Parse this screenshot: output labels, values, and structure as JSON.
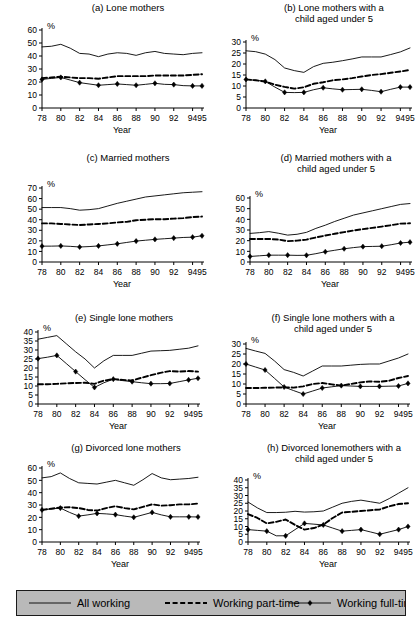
{
  "figure": {
    "axis_title_x": "Year",
    "axis_title_y": "%",
    "years": [
      78,
      80,
      82,
      84,
      86,
      88,
      90,
      92,
      94,
      95
    ],
    "xtick_labels": [
      "78",
      "80",
      "82",
      "84",
      "86",
      "88",
      "90",
      "92",
      "94",
      "95"
    ],
    "line_color": "#000000",
    "background_color": "#ffffff",
    "legend": {
      "background_color": "#b9b9b9",
      "border_color": "#1a1a1a",
      "items": [
        {
          "key": "all_working",
          "label": "All working",
          "style": "solid",
          "marker": "none"
        },
        {
          "key": "part_time",
          "label": "Working part-time",
          "style": "dashed",
          "marker": "none"
        },
        {
          "key": "full_time",
          "label": "Working full-time",
          "style": "solid",
          "marker": "diamond"
        }
      ]
    }
  },
  "chart_data": [
    {
      "id": "a",
      "type": "line",
      "title": "(a) Lone mothers",
      "xlabel": "Year",
      "ylabel": "%",
      "ylim": [
        0,
        60
      ],
      "ytick_step": 10,
      "ytick_labels": [
        "0",
        "10",
        "20",
        "30",
        "40",
        "50",
        "60"
      ],
      "grid": false,
      "x": [
        78,
        79,
        80,
        81,
        82,
        83,
        84,
        85,
        86,
        87,
        88,
        89,
        90,
        91,
        92,
        93,
        94,
        95
      ],
      "series": [
        {
          "name": "All working",
          "values": [
            47.0,
            47.5,
            49.0,
            46.0,
            42.0,
            41.5,
            39.5,
            41.5,
            42.5,
            42.0,
            40.5,
            42.5,
            43.5,
            42.0,
            41.5,
            41.0,
            42.0,
            42.5
          ]
        },
        {
          "name": "Working part-time",
          "values": [
            23.0,
            23.5,
            24.0,
            23.5,
            23.0,
            23.0,
            22.5,
            23.5,
            24.5,
            24.5,
            24.5,
            24.5,
            25.0,
            25.0,
            25.0,
            25.0,
            25.5,
            26.0
          ]
        },
        {
          "name": "Working full-time",
          "values": [
            22.0,
            22.8,
            23.5,
            21.5,
            19.5,
            18.5,
            17.5,
            18.0,
            18.5,
            18.0,
            17.5,
            18.2,
            19.0,
            18.2,
            18.0,
            17.2,
            17.0,
            17.0
          ]
        }
      ],
      "marker_x": [
        78,
        80,
        82,
        84,
        86,
        88,
        90,
        92,
        94,
        95
      ],
      "marker_y": [
        22.0,
        23.5,
        19.5,
        17.5,
        18.5,
        17.5,
        19.0,
        18.0,
        17.0,
        17.0
      ]
    },
    {
      "id": "b",
      "type": "line",
      "title": "(b) Lone mothers with a child aged under 5",
      "xlabel": "Year",
      "ylabel": "%",
      "ylim": [
        0,
        30
      ],
      "ytick_step": 5,
      "ytick_labels": [
        "0",
        "5",
        "10",
        "15",
        "20",
        "25",
        "30"
      ],
      "grid": false,
      "x": [
        78,
        79,
        80,
        81,
        82,
        83,
        84,
        85,
        86,
        87,
        88,
        89,
        90,
        91,
        92,
        93,
        94,
        95
      ],
      "series": [
        {
          "name": "All working",
          "values": [
            26.0,
            25.6,
            24.5,
            22.0,
            18.2,
            17.0,
            16.2,
            18.8,
            20.3,
            20.8,
            21.5,
            22.3,
            23.2,
            23.2,
            23.2,
            24.3,
            25.5,
            27.3
          ]
        },
        {
          "name": "Working part-time",
          "values": [
            13.0,
            12.6,
            12.0,
            10.6,
            9.6,
            8.8,
            9.4,
            11.0,
            11.7,
            12.6,
            13.0,
            13.6,
            14.3,
            15.0,
            15.4,
            16.0,
            16.6,
            17.3
          ]
        },
        {
          "name": "Working full-time",
          "values": [
            13.0,
            12.6,
            12.1,
            9.5,
            7.1,
            7.0,
            7.1,
            8.3,
            9.2,
            8.7,
            8.3,
            8.4,
            8.5,
            8.0,
            7.4,
            8.5,
            9.5,
            9.5
          ]
        }
      ],
      "marker_x": [
        78,
        80,
        82,
        84,
        86,
        88,
        90,
        92,
        94,
        95
      ],
      "marker_y": [
        13.0,
        12.1,
        7.1,
        7.1,
        9.2,
        8.3,
        8.5,
        7.4,
        9.5,
        9.5
      ]
    },
    {
      "id": "c",
      "type": "line",
      "title": "(c) Married mothers",
      "xlabel": "Year",
      "ylabel": "%",
      "ylim": [
        0,
        70
      ],
      "ytick_step": 10,
      "ytick_labels": [
        "0",
        "10",
        "20",
        "30",
        "40",
        "50",
        "60",
        "70"
      ],
      "grid": false,
      "x": [
        78,
        79,
        80,
        81,
        82,
        83,
        84,
        85,
        86,
        87,
        88,
        89,
        90,
        91,
        92,
        93,
        94,
        95
      ],
      "series": [
        {
          "name": "All working",
          "values": [
            51.5,
            51.5,
            51.5,
            50.5,
            49.0,
            49.5,
            50.5,
            53.0,
            55.5,
            57.5,
            59.5,
            61.5,
            62.5,
            63.5,
            64.5,
            65.5,
            66.0,
            66.5
          ]
        },
        {
          "name": "Working part-time",
          "values": [
            36.5,
            36.5,
            36.0,
            35.5,
            35.0,
            35.5,
            36.0,
            36.5,
            37.5,
            38.0,
            39.5,
            40.0,
            40.5,
            40.5,
            41.0,
            41.5,
            42.5,
            43.0
          ]
        },
        {
          "name": "Working full-time",
          "values": [
            15.0,
            15.0,
            15.2,
            14.8,
            14.2,
            14.6,
            15.2,
            16.2,
            17.2,
            18.5,
            19.8,
            20.6,
            21.4,
            22.0,
            22.6,
            23.2,
            23.5,
            24.8
          ]
        }
      ],
      "marker_x": [
        78,
        80,
        82,
        84,
        86,
        88,
        90,
        92,
        94,
        95
      ],
      "marker_y": [
        15.0,
        15.2,
        14.2,
        15.2,
        17.2,
        19.8,
        21.4,
        22.6,
        23.5,
        24.8
      ]
    },
    {
      "id": "d",
      "type": "line",
      "title": "(d) Married mothers with a child aged under 5",
      "xlabel": "Year",
      "ylabel": "%",
      "ylim": [
        0,
        60
      ],
      "ytick_step": 10,
      "ytick_labels": [
        "0",
        "10",
        "20",
        "30",
        "40",
        "50",
        "60"
      ],
      "grid": false,
      "x": [
        78,
        79,
        80,
        81,
        82,
        83,
        84,
        85,
        86,
        87,
        88,
        89,
        90,
        91,
        92,
        93,
        94,
        95
      ],
      "series": [
        {
          "name": "All working",
          "values": [
            26.8,
            27.5,
            28.5,
            27.0,
            25.2,
            26.0,
            27.8,
            31.5,
            34.5,
            38.0,
            41.0,
            44.0,
            46.0,
            48.0,
            50.0,
            52.0,
            54.0,
            54.8
          ]
        },
        {
          "name": "Working part-time",
          "values": [
            21.5,
            21.6,
            21.6,
            21.0,
            19.6,
            20.0,
            21.0,
            23.0,
            24.8,
            26.5,
            28.0,
            29.5,
            30.8,
            32.0,
            33.2,
            34.5,
            36.0,
            36.3
          ]
        },
        {
          "name": "Working full-time",
          "values": [
            5.2,
            5.8,
            6.4,
            6.4,
            6.4,
            6.2,
            6.3,
            7.8,
            9.6,
            11.0,
            12.4,
            13.5,
            14.4,
            14.6,
            14.8,
            16.2,
            17.8,
            18.6
          ]
        }
      ],
      "marker_x": [
        78,
        80,
        82,
        84,
        86,
        88,
        90,
        92,
        94,
        95
      ],
      "marker_y": [
        5.2,
        6.4,
        6.4,
        6.3,
        9.6,
        12.4,
        14.4,
        14.8,
        17.8,
        18.6
      ]
    },
    {
      "id": "e",
      "type": "line",
      "title": "(e) Single lone mothers",
      "xlabel": "Year",
      "ylabel": "%",
      "ylim": [
        0,
        40
      ],
      "ytick_step": 5,
      "ytick_labels": [
        "0",
        "5",
        "10",
        "15",
        "20",
        "25",
        "30",
        "35",
        "40"
      ],
      "grid": false,
      "x": [
        78,
        79,
        80,
        81,
        82,
        83,
        84,
        85,
        86,
        87,
        88,
        89,
        90,
        91,
        92,
        93,
        94,
        95
      ],
      "series": [
        {
          "name": "All working",
          "values": [
            36.0,
            37.0,
            38.0,
            33.5,
            29.0,
            25.0,
            20.0,
            24.0,
            27.0,
            27.0,
            27.0,
            28.2,
            29.4,
            29.6,
            29.8,
            30.4,
            31.0,
            32.3
          ]
        },
        {
          "name": "Working part-time",
          "values": [
            11.0,
            11.0,
            11.2,
            11.5,
            11.7,
            11.8,
            11.2,
            13.0,
            13.8,
            13.4,
            13.0,
            14.6,
            16.0,
            17.3,
            18.3,
            18.0,
            18.3,
            18.0
          ]
        },
        {
          "name": "Working full-time",
          "values": [
            25.2,
            26.0,
            27.0,
            22.5,
            18.0,
            13.5,
            9.2,
            11.8,
            13.8,
            13.0,
            12.4,
            11.8,
            11.3,
            11.3,
            11.4,
            12.4,
            13.4,
            14.3
          ]
        }
      ],
      "marker_x": [
        78,
        80,
        82,
        84,
        86,
        88,
        90,
        92,
        94,
        95
      ],
      "marker_y": [
        25.2,
        27.0,
        18.0,
        9.2,
        13.8,
        12.4,
        11.3,
        11.4,
        13.4,
        14.3
      ]
    },
    {
      "id": "f",
      "type": "line",
      "title": "(f) Single lone mothers with a child aged under 5",
      "xlabel": "Year",
      "ylabel": "%",
      "ylim": [
        0,
        30
      ],
      "ytick_step": 5,
      "ytick_labels": [
        "0",
        "5",
        "10",
        "15",
        "20",
        "25",
        "30"
      ],
      "grid": false,
      "x": [
        78,
        79,
        80,
        81,
        82,
        83,
        84,
        85,
        86,
        87,
        88,
        89,
        90,
        91,
        92,
        93,
        94,
        95
      ],
      "series": [
        {
          "name": "All working",
          "values": [
            27.8,
            26.5,
            25.3,
            21.5,
            17.2,
            15.8,
            14.0,
            16.5,
            19.0,
            19.0,
            19.0,
            19.4,
            19.8,
            20.0,
            20.0,
            21.5,
            23.0,
            25.0
          ]
        },
        {
          "name": "Working part-time",
          "values": [
            8.0,
            8.0,
            8.1,
            8.2,
            8.3,
            8.2,
            8.8,
            10.0,
            10.5,
            9.8,
            9.2,
            10.0,
            10.8,
            11.3,
            11.1,
            11.6,
            13.0,
            14.0
          ]
        },
        {
          "name": "Working full-time",
          "values": [
            20.0,
            18.5,
            17.0,
            12.8,
            8.5,
            6.7,
            5.0,
            6.5,
            8.0,
            8.6,
            9.2,
            9.0,
            8.8,
            8.8,
            8.8,
            8.9,
            9.0,
            10.3
          ]
        }
      ],
      "marker_x": [
        78,
        80,
        82,
        84,
        86,
        88,
        90,
        92,
        94,
        95
      ],
      "marker_y": [
        20.0,
        17.0,
        8.5,
        5.0,
        8.0,
        9.2,
        8.8,
        8.8,
        9.0,
        10.3
      ]
    },
    {
      "id": "g",
      "type": "line",
      "title": "(g) Divorced lone mothers",
      "xlabel": "Year",
      "ylabel": "%",
      "ylim": [
        0,
        60
      ],
      "ytick_step": 10,
      "ytick_labels": [
        "0",
        "10",
        "20",
        "30",
        "40",
        "50",
        "60"
      ],
      "grid": false,
      "x": [
        78,
        79,
        80,
        81,
        82,
        83,
        84,
        85,
        86,
        87,
        88,
        89,
        90,
        91,
        92,
        93,
        94,
        95
      ],
      "series": [
        {
          "name": "All working",
          "values": [
            52.0,
            53.0,
            56.0,
            51.5,
            48.0,
            47.5,
            47.0,
            48.5,
            50.0,
            48.0,
            46.0,
            50.5,
            55.5,
            52.0,
            50.5,
            51.0,
            51.5,
            52.5
          ]
        },
        {
          "name": "Working part-time",
          "values": [
            26.0,
            27.0,
            28.0,
            28.2,
            27.5,
            26.0,
            25.5,
            27.5,
            29.0,
            27.5,
            26.5,
            28.5,
            30.5,
            29.5,
            29.8,
            30.5,
            30.5,
            31.2
          ]
        },
        {
          "name": "Working full-time",
          "values": [
            26.0,
            26.8,
            27.5,
            24.0,
            21.0,
            22.0,
            23.2,
            22.8,
            22.2,
            21.0,
            20.0,
            22.0,
            24.0,
            22.0,
            20.4,
            20.4,
            20.4,
            20.3
          ]
        }
      ],
      "marker_x": [
        78,
        80,
        82,
        84,
        86,
        88,
        90,
        92,
        94,
        95
      ],
      "marker_y": [
        26.0,
        27.5,
        21.0,
        23.2,
        22.2,
        20.0,
        24.0,
        20.4,
        20.4,
        20.3
      ]
    },
    {
      "id": "h",
      "type": "line",
      "title": "(h) Divorced lonemothers with a child aged under 5",
      "xlabel": "Year",
      "ylabel": "%",
      "ylim": [
        0,
        40
      ],
      "ytick_step": 5,
      "ytick_labels": [
        "0",
        "5",
        "10",
        "15",
        "20",
        "25",
        "30",
        "35",
        "40"
      ],
      "grid": false,
      "x": [
        78,
        79,
        80,
        81,
        82,
        83,
        84,
        85,
        86,
        87,
        88,
        89,
        90,
        91,
        92,
        93,
        94,
        95
      ],
      "series": [
        {
          "name": "All working",
          "values": [
            25.8,
            22.0,
            19.0,
            19.0,
            19.2,
            19.8,
            19.3,
            19.5,
            20.0,
            22.5,
            25.0,
            26.2,
            27.0,
            26.0,
            25.0,
            28.0,
            31.5,
            35.0
          ]
        },
        {
          "name": "Working part-time",
          "values": [
            18.0,
            15.5,
            12.0,
            13.0,
            14.5,
            11.0,
            8.0,
            9.0,
            11.2,
            15.5,
            19.0,
            19.5,
            20.0,
            20.5,
            21.0,
            23.0,
            24.5,
            25.0
          ]
        },
        {
          "name": "Working full-time",
          "values": [
            8.0,
            7.5,
            7.0,
            4.0,
            4.0,
            8.0,
            12.0,
            11.5,
            11.0,
            9.0,
            7.0,
            7.5,
            8.0,
            6.5,
            5.0,
            6.5,
            8.0,
            10.0
          ]
        }
      ],
      "marker_x": [
        78,
        80,
        82,
        84,
        86,
        88,
        90,
        92,
        94,
        95
      ],
      "marker_y": [
        8.0,
        7.0,
        4.0,
        12.0,
        11.0,
        7.0,
        8.0,
        5.0,
        8.0,
        10.0
      ]
    }
  ]
}
